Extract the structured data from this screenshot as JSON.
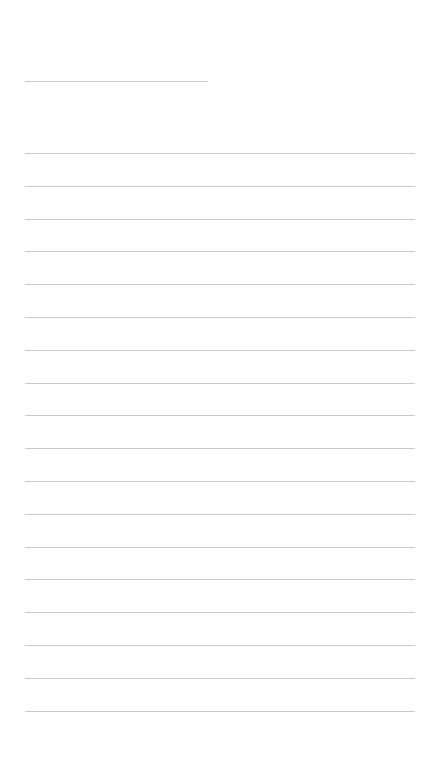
{
  "page": {
    "background": "#ffffff",
    "line_color": "#c8c8c8",
    "header_line": {
      "top": 81,
      "left": 25,
      "width": 183
    },
    "ruled_lines": {
      "count": 18,
      "first_top": 153,
      "spacing": 32.8,
      "left": 25,
      "width": 390
    }
  }
}
